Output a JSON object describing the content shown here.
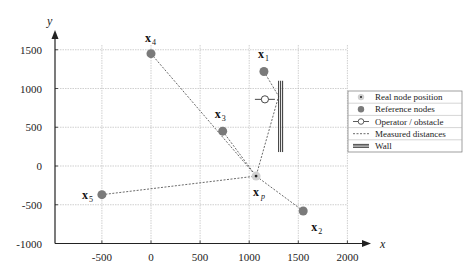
{
  "chart_data": {
    "type": "scatter",
    "title": "",
    "xlabel": "x",
    "ylabel": "y",
    "xlim": [
      -1000,
      2000
    ],
    "ylim": [
      -1000,
      1700
    ],
    "xticks": [
      -500,
      0,
      500,
      1000,
      1500,
      2000
    ],
    "yticks": [
      -1000,
      -500,
      0,
      500,
      1000,
      1500
    ],
    "xtick_labels": [
      "-500",
      "0",
      "500",
      "1000",
      "1500",
      "2000"
    ],
    "ytick_labels": [
      "-1000",
      "-500",
      "0",
      "500",
      "1000",
      "1500"
    ],
    "grid": true,
    "reference_nodes": [
      {
        "label": "x",
        "sub": "1",
        "x": 1150,
        "y": 1220
      },
      {
        "label": "x",
        "sub": "2",
        "x": 1550,
        "y": -580
      },
      {
        "label": "x",
        "sub": "3",
        "x": 730,
        "y": 450
      },
      {
        "label": "x",
        "sub": "4",
        "x": 0,
        "y": 1450
      },
      {
        "label": "x",
        "sub": "5",
        "x": -500,
        "y": -370
      }
    ],
    "real_node": {
      "label": "x",
      "sub": "p",
      "x": 1070,
      "y": -130
    },
    "operator": {
      "x": 1160,
      "y": 860
    },
    "wall": {
      "x": 1320,
      "y_top": 1100,
      "y_bottom": 180
    },
    "measured_distances": [
      {
        "from": "x1",
        "to": "xp",
        "via": "wall"
      },
      {
        "from": "x2",
        "to": "xp"
      },
      {
        "from": "x3",
        "to": "xp"
      },
      {
        "from": "x4",
        "to": "xp"
      },
      {
        "from": "x5",
        "to": "xp"
      }
    ],
    "legend": {
      "position": "right",
      "entries": [
        {
          "symbol": "real-node",
          "label": "Real node position"
        },
        {
          "symbol": "reference-node",
          "label": "Reference nodes"
        },
        {
          "symbol": "operator",
          "label": "Operator / obstacle"
        },
        {
          "symbol": "dashed-line",
          "label": "Measured distances"
        },
        {
          "symbol": "wall",
          "label": "Wall"
        }
      ]
    }
  },
  "colors": {
    "node": "#7a7a7a",
    "real_node_halo": "#d0d0d0",
    "axis": "#222222",
    "grid": "#b0b0b0",
    "wall": "#333333"
  }
}
